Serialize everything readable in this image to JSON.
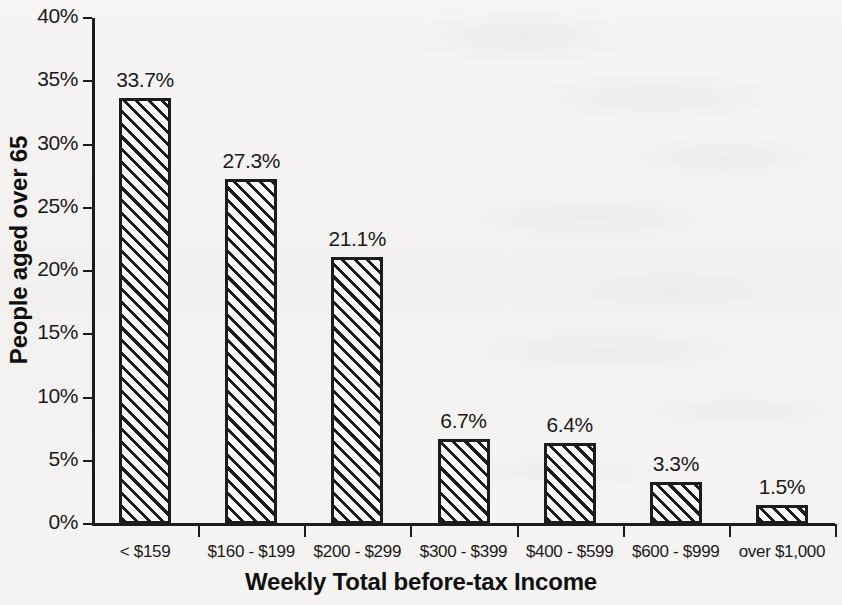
{
  "chart_data": {
    "type": "bar",
    "title": "",
    "xlabel": "Weekly Total before-tax Income",
    "ylabel": "People aged over 65",
    "categories": [
      "< $159",
      "$160 - $199",
      "$200 - $299",
      "$300 - $399",
      "$400 - $599",
      "$600 - $999",
      "over $1,000"
    ],
    "values": [
      33.7,
      27.3,
      21.1,
      6.7,
      6.4,
      3.3,
      1.5
    ],
    "value_labels": [
      "33.7%",
      "27.3%",
      "21.1%",
      "6.7%",
      "6.4%",
      "3.3%",
      "1.5%"
    ],
    "ylim": [
      0,
      40
    ],
    "ytick_values": [
      0,
      5,
      10,
      15,
      20,
      25,
      30,
      35,
      40
    ],
    "ytick_labels": [
      "0%",
      "5%",
      "10%",
      "15%",
      "20%",
      "25%",
      "30%",
      "35%",
      "40%"
    ],
    "grid": false,
    "legend": false,
    "legend_position": "none",
    "bar_fill": "diagonal-hatch",
    "bar_border_color": "#1c1c1c",
    "background_color": "#f4f3f1"
  }
}
